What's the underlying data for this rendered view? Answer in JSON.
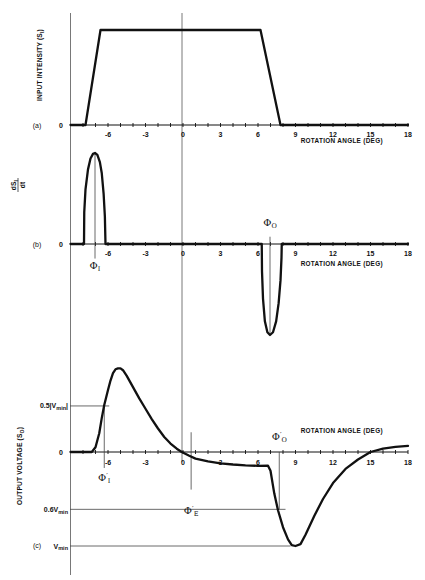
{
  "figure": {
    "background": "#ffffff",
    "ink_color": "#111111",
    "guide_color": "#555555"
  },
  "chart_data": [
    {
      "panel": "a",
      "type": "line",
      "panel_label": "(a)",
      "ylabel": {
        "main": "INPUT INTENSITY (S",
        "sub": "I",
        "end": ")"
      },
      "y_zero_label": "0",
      "xlabel": "ROTATION ANGLE (DEG)",
      "xlim": [
        -9,
        18
      ],
      "xticks": [
        -6,
        -3,
        0,
        3,
        6,
        9,
        12,
        15,
        18
      ],
      "xtick_labels": [
        "-6",
        "-3",
        "0",
        "3",
        "6",
        "9",
        "12",
        "15",
        "18"
      ],
      "ylim": [
        0,
        1
      ],
      "series": [
        {
          "name": "S_I",
          "points": [
            [
              -9,
              0
            ],
            [
              -7.8,
              0
            ],
            [
              -6.6,
              1
            ],
            [
              6.2,
              1
            ],
            [
              7.8,
              0
            ],
            [
              18,
              0
            ]
          ]
        }
      ],
      "annotations": []
    },
    {
      "panel": "b",
      "type": "line",
      "panel_label": "(b)",
      "ylabel": {
        "num_main": "dS",
        "num_sub": "I",
        "den": "dt"
      },
      "y_zero_label": "0",
      "xlabel": "ROTATION ANGLE (DEG)",
      "xlim": [
        -9,
        18
      ],
      "xticks": [
        -6,
        -3,
        0,
        3,
        6,
        9,
        12,
        15,
        18
      ],
      "xtick_labels": [
        "-6",
        "-3",
        "0",
        "3",
        "6",
        "9",
        "12",
        "15",
        "18"
      ],
      "ylim": [
        -1,
        1
      ],
      "series": [
        {
          "name": "dS_I/dt",
          "points": [
            [
              -9,
              0
            ],
            [
              -7.92,
              0
            ],
            [
              -7.9,
              0.35
            ],
            [
              -7.8,
              0.6
            ],
            [
              -7.6,
              0.82
            ],
            [
              -7.4,
              0.94
            ],
            [
              -7.2,
              0.99
            ],
            [
              -7.04,
              1.0
            ],
            [
              -6.85,
              0.98
            ],
            [
              -6.65,
              0.9
            ],
            [
              -6.5,
              0.78
            ],
            [
              -6.35,
              0.55
            ],
            [
              -6.25,
              0.3
            ],
            [
              -6.2,
              0
            ],
            [
              6.3,
              0
            ],
            [
              6.32,
              -0.3
            ],
            [
              6.4,
              -0.6
            ],
            [
              6.55,
              -0.85
            ],
            [
              6.75,
              -0.97
            ],
            [
              6.96,
              -1.0
            ],
            [
              7.2,
              -0.97
            ],
            [
              7.45,
              -0.85
            ],
            [
              7.65,
              -0.65
            ],
            [
              7.8,
              -0.4
            ],
            [
              7.88,
              -0.15
            ],
            [
              7.9,
              0
            ],
            [
              18,
              0
            ]
          ]
        }
      ],
      "annotations": [
        {
          "kind": "vline",
          "x": -7.04,
          "y_from": 1.0,
          "y_to": -0.16,
          "label": {
            "symbol": "Φ",
            "prime": "",
            "sub": "I",
            "dy": 22
          }
        },
        {
          "kind": "vline",
          "x": 6.96,
          "y_from": 0.08,
          "y_to": -1.0,
          "label": {
            "symbol": "Φ",
            "prime": "",
            "sub": "O",
            "dy": -11
          }
        }
      ]
    },
    {
      "panel": "c",
      "type": "line",
      "panel_label": "(c)",
      "ylabel": {
        "main": "OUTPUT VOLTAGE (S",
        "sub": "O",
        "end": ")"
      },
      "y_zero_label": "0",
      "y_ref_labels": [
        {
          "text": "0.5|V",
          "sub": "min",
          "end": "|",
          "value": 0.49,
          "x_end": -5.9
        },
        {
          "text": "0.6V",
          "sub": "min",
          "end": "",
          "value": -0.61,
          "x_end": 8.2
        },
        {
          "text": "V",
          "sub": "min",
          "end": "",
          "value": -1.0,
          "x_end": 8.6
        }
      ],
      "xlabel": "ROTATION ANGLE (DEG)",
      "xlim": [
        -9,
        18
      ],
      "xticks": [
        -6,
        -3,
        0,
        3,
        6,
        9,
        12,
        15,
        18
      ],
      "xtick_labels": [
        "-6",
        "-3",
        "0",
        "3",
        "6",
        "9",
        "12",
        "15",
        "18"
      ],
      "ylim": [
        -1,
        0.9
      ],
      "series": [
        {
          "name": "S_O",
          "points": [
            [
              -9,
              0
            ],
            [
              -7.3,
              0
            ],
            [
              -7.0,
              0.05
            ],
            [
              -6.7,
              0.2
            ],
            [
              -6.5,
              0.36
            ],
            [
              -6.3,
              0.5
            ],
            [
              -6.0,
              0.66
            ],
            [
              -5.8,
              0.76
            ],
            [
              -5.6,
              0.84
            ],
            [
              -5.4,
              0.88
            ],
            [
              -5.2,
              0.89
            ],
            [
              -5.0,
              0.89
            ],
            [
              -4.8,
              0.87
            ],
            [
              -4.5,
              0.81
            ],
            [
              -4.0,
              0.69
            ],
            [
              -3.5,
              0.57
            ],
            [
              -3.0,
              0.46
            ],
            [
              -2.5,
              0.35
            ],
            [
              -2.0,
              0.25
            ],
            [
              -1.5,
              0.16
            ],
            [
              -1.0,
              0.09
            ],
            [
              -0.5,
              0.035
            ],
            [
              -0.1,
              0.0
            ],
            [
              0.5,
              -0.04
            ],
            [
              1.0,
              -0.07
            ],
            [
              2.0,
              -0.1
            ],
            [
              3.0,
              -0.12
            ],
            [
              4.0,
              -0.133
            ],
            [
              5.0,
              -0.142
            ],
            [
              6.0,
              -0.147
            ],
            [
              6.8,
              -0.145
            ],
            [
              7.0,
              -0.2
            ],
            [
              7.3,
              -0.44
            ],
            [
              7.6,
              -0.62
            ],
            [
              8.0,
              -0.8
            ],
            [
              8.4,
              -0.93
            ],
            [
              8.7,
              -0.99
            ],
            [
              9.0,
              -1.0
            ],
            [
              9.4,
              -0.98
            ],
            [
              9.8,
              -0.88
            ],
            [
              10.5,
              -0.68
            ],
            [
              11.2,
              -0.5
            ],
            [
              12.0,
              -0.33
            ],
            [
              13.0,
              -0.18
            ],
            [
              14.0,
              -0.08
            ],
            [
              15.0,
              0.0
            ],
            [
              16.0,
              0.035
            ],
            [
              17.0,
              0.055
            ],
            [
              18.0,
              0.065
            ]
          ]
        }
      ],
      "annotations": [
        {
          "kind": "vline",
          "x": -6.3,
          "y_from": 0.49,
          "y_to": -0.17,
          "label": {
            "symbol": "Φ",
            "prime": "′",
            "sub": "I",
            "dy": 25
          }
        },
        {
          "kind": "vline",
          "x": 0.65,
          "y_from": 0.21,
          "y_to": -0.4,
          "label": {
            "symbol": "Φ",
            "prime": "′",
            "sub": "E",
            "dy": 36
          }
        },
        {
          "kind": "vline",
          "x": 7.7,
          "y_from": 0.0,
          "y_to": -0.61,
          "label": {
            "symbol": "Φ",
            "prime": "′",
            "sub": "O",
            "dy": -12
          }
        }
      ]
    }
  ]
}
